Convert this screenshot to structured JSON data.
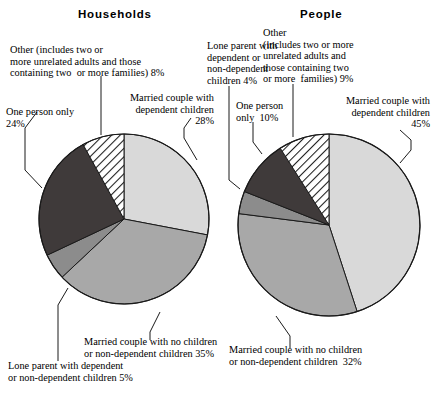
{
  "figure": {
    "background": "#ffffff",
    "outline_color": "#1a1a1a"
  },
  "charts": [
    {
      "id": "households",
      "title": "Households",
      "title_pos": {
        "x": 78,
        "y": 8
      },
      "center": {
        "x": 124,
        "y": 219
      },
      "radius": 85,
      "labels": {
        "other": "Other (includes two or\nmore unrelated adults and those\ncontaining two  or more families) 8%",
        "one_person": "One person only\n24%",
        "married_dependent": "Married couple with\ndependent children\n28%",
        "married_no_dependent": "Married couple with no children\nor non-dependent children 35%",
        "lone_parent": "Lone parent with dependent\nor non-dependent children 5%"
      }
    },
    {
      "id": "people",
      "title": "People",
      "title_pos": {
        "x": 300,
        "y": 8
      },
      "center": {
        "x": 329,
        "y": 225
      },
      "radius": 91,
      "labels": {
        "other": "Other\n(includes two or more\nunrelated adults and\nthose containing two\nor more  families) 9%",
        "one_person": "One person\nonly  10%",
        "married_dependent": "Married couple with\ndependent children\n45%",
        "married_no_dependent": "Married couple with no children\nor non-dependent children  32%",
        "lone_parent": "Lone parent with\ndependent or\nnon-dependent\nchildren 4%"
      }
    }
  ],
  "chart_data": [
    {
      "type": "pie",
      "title": "Households",
      "unit": "%",
      "start_angle_deg": 0,
      "direction": "clockwise",
      "categories": [
        "Married couple with dependent children",
        "Married couple with no children or non-dependent children",
        "Lone parent with dependent or non-dependent children",
        "One person only",
        "Other (includes two or more unrelated adults and those containing two or more families)"
      ],
      "values": [
        28,
        35,
        5,
        24,
        8
      ],
      "labels": [
        "28%",
        "35%",
        "5%",
        "24%",
        "8%"
      ],
      "fills": [
        "#d9d9d9",
        "#a8a8a8",
        "#8c8c8c",
        "#3f3a3a",
        "hatch"
      ],
      "legend": "none"
    },
    {
      "type": "pie",
      "title": "People",
      "unit": "%",
      "start_angle_deg": 0,
      "direction": "clockwise",
      "categories": [
        "Married couple with dependent children",
        "Married couple with no children or non-dependent children",
        "Lone parent with dependent or non-dependent children",
        "One person only",
        "Other (includes two or more unrelated adults and those containing two or more families)"
      ],
      "values": [
        45,
        32,
        4,
        10,
        9
      ],
      "labels": [
        "45%",
        "32%",
        "4%",
        "10%",
        "9%"
      ],
      "fills": [
        "#d9d9d9",
        "#a8a8a8",
        "#8c8c8c",
        "#3f3a3a",
        "hatch"
      ],
      "legend": "none"
    }
  ]
}
